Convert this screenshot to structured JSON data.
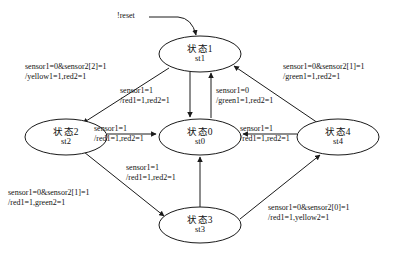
{
  "diagram": {
    "type": "finite-state-machine",
    "title": "",
    "reset": {
      "label": "!reset",
      "target": "st1"
    },
    "states": [
      {
        "id": "st1",
        "cn_name": "状态1",
        "code": "st1",
        "cx": 200,
        "cy": 54,
        "rx": 41,
        "ry": 18
      },
      {
        "id": "st2",
        "cn_name": "状态2",
        "code": "st2",
        "cx": 66,
        "cy": 137,
        "rx": 41,
        "ry": 18
      },
      {
        "id": "st0",
        "cn_name": "状态0",
        "code": "st0",
        "cx": 200,
        "cy": 137,
        "rx": 41,
        "ry": 18
      },
      {
        "id": "st4",
        "cn_name": "状态4",
        "code": "st4",
        "cx": 338,
        "cy": 137,
        "rx": 41,
        "ry": 18
      },
      {
        "id": "st3",
        "cn_name": "状态3",
        "code": "st3",
        "cx": 200,
        "cy": 225,
        "rx": 41,
        "ry": 18
      }
    ],
    "transitions": [
      {
        "from": "st1",
        "to": "st2",
        "condition": "sensor1=0&sensor2[2]=1",
        "action": "/yellow1=1,red2=1"
      },
      {
        "from": "st4",
        "to": "st1",
        "condition": "sensor1=0&sensor2[1]=1",
        "action": "/green1=1,red2=1"
      },
      {
        "from": "st1",
        "to": "st0",
        "condition": "sensor1=1",
        "action": "/red1=1,red2=1"
      },
      {
        "from": "st0",
        "to": "st1",
        "condition": "sensor1=0",
        "action": "/green1=1,red2=1"
      },
      {
        "from": "st2",
        "to": "st0",
        "condition": "sensor1=1",
        "action": "/red1=1,red2=1"
      },
      {
        "from": "st4",
        "to": "st0",
        "condition": "sensor1=1",
        "action": "/red1=1,red2=1"
      },
      {
        "from": "st2",
        "to": "st3",
        "condition": "sensor1=0&sensor2[1]=1",
        "action": "/red1=1,green2=1"
      },
      {
        "from": "st3",
        "to": "st0",
        "condition": "sensor1=1",
        "action": "/red1=1,red2=1"
      },
      {
        "from": "st3",
        "to": "st4",
        "condition": "sensor1=0&sensor2[0]=1",
        "action": "/red1=1,yellow2=1"
      }
    ],
    "colors": {
      "stroke": "#1a1a1a",
      "text": "#111111",
      "background": "#ffffff"
    }
  }
}
